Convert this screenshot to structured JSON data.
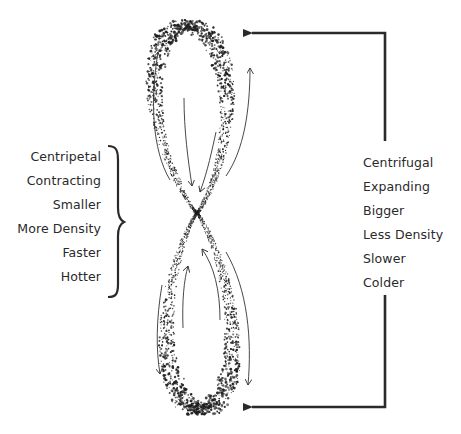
{
  "diagram": {
    "type": "figure-eight vortex flow",
    "left_group": {
      "bracket": "right-curly-brace",
      "labels": [
        "Centripetal",
        "Contracting",
        "Smaller",
        "More Density",
        "Faster",
        "Hotter"
      ]
    },
    "right_group": {
      "connector": "bracket line with arrows pointing to top and bottom lobes",
      "labels": [
        "Centrifugal",
        "Expanding",
        "Bigger",
        "Less Density",
        "Slower",
        "Colder"
      ]
    },
    "colors": {
      "ink": "#2a2a2a",
      "background": "#ffffff"
    }
  }
}
